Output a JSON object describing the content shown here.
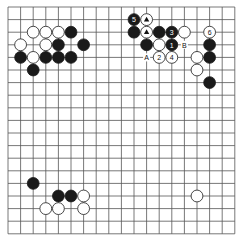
{
  "board": {
    "size": 19,
    "origin_x": 8,
    "origin_y": 7,
    "spacing": 12.6,
    "line_color": "#555555",
    "black_color": "#1a1a1a",
    "white_color": "#ffffff"
  },
  "stones": [
    {
      "color": "white",
      "col": 2,
      "row": 2
    },
    {
      "color": "white",
      "col": 3,
      "row": 2
    },
    {
      "color": "white",
      "col": 4,
      "row": 2
    },
    {
      "color": "black",
      "col": 5,
      "row": 2
    },
    {
      "color": "white",
      "col": 1,
      "row": 3
    },
    {
      "color": "white",
      "col": 3,
      "row": 3
    },
    {
      "color": "black",
      "col": 4,
      "row": 3
    },
    {
      "color": "black",
      "col": 6,
      "row": 3
    },
    {
      "color": "black",
      "col": 1,
      "row": 4
    },
    {
      "color": "white",
      "col": 2,
      "row": 4
    },
    {
      "color": "black",
      "col": 3,
      "row": 4
    },
    {
      "color": "black",
      "col": 4,
      "row": 4
    },
    {
      "color": "black",
      "col": 5,
      "row": 4
    },
    {
      "color": "black",
      "col": 2,
      "row": 5
    },
    {
      "color": "black",
      "col": 10,
      "row": 1,
      "label": "5"
    },
    {
      "color": "white",
      "col": 11,
      "row": 1,
      "mark": "triangle"
    },
    {
      "color": "black",
      "col": 10,
      "row": 2
    },
    {
      "color": "white",
      "col": 11,
      "row": 2,
      "mark": "triangle"
    },
    {
      "color": "black",
      "col": 12,
      "row": 2
    },
    {
      "color": "black",
      "col": 13,
      "row": 2,
      "label": "3"
    },
    {
      "color": "white",
      "col": 14,
      "row": 2
    },
    {
      "color": "white",
      "col": 16,
      "row": 2,
      "label": "6"
    },
    {
      "color": "black",
      "col": 11,
      "row": 3
    },
    {
      "color": "white",
      "col": 12,
      "row": 3
    },
    {
      "color": "black",
      "col": 13,
      "row": 3,
      "label": "1"
    },
    {
      "color": "black",
      "col": 16,
      "row": 3
    },
    {
      "color": "white",
      "col": 12,
      "row": 4,
      "label": "2"
    },
    {
      "color": "white",
      "col": 13,
      "row": 4,
      "label": "4"
    },
    {
      "color": "white",
      "col": 15,
      "row": 4
    },
    {
      "color": "black",
      "col": 16,
      "row": 4
    },
    {
      "color": "white",
      "col": 15,
      "row": 5
    },
    {
      "color": "black",
      "col": 16,
      "row": 6
    },
    {
      "color": "black",
      "col": 2,
      "row": 14
    },
    {
      "color": "black",
      "col": 4,
      "row": 15
    },
    {
      "color": "black",
      "col": 5,
      "row": 15
    },
    {
      "color": "white",
      "col": 6,
      "row": 15
    },
    {
      "color": "white",
      "col": 3,
      "row": 16
    },
    {
      "color": "white",
      "col": 4,
      "row": 16
    },
    {
      "color": "white",
      "col": 6,
      "row": 16
    },
    {
      "color": "white",
      "col": 15,
      "row": 15
    }
  ],
  "point_labels": [
    {
      "text": "A",
      "col": 11,
      "row": 4
    },
    {
      "text": "B",
      "col": 14,
      "row": 3
    }
  ]
}
